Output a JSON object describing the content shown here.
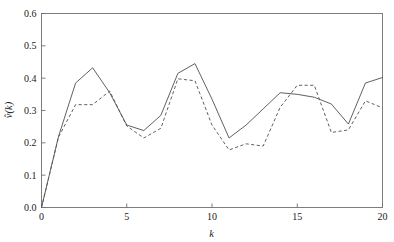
{
  "chart_data": {
    "type": "line",
    "title": "",
    "subtitle": "",
    "xlabel": "k",
    "ylabel": "v̂(k)",
    "xlim": [
      0,
      20
    ],
    "ylim": [
      0.0,
      0.6
    ],
    "grid": false,
    "legend": null,
    "legend_position": "none",
    "x_ticks": [
      0,
      5,
      10,
      15,
      20
    ],
    "x_tick_labels": [
      "0",
      "5",
      "10",
      "15",
      "20"
    ],
    "y_ticks": [
      0.0,
      0.1,
      0.2,
      0.3,
      0.4,
      0.5,
      0.6
    ],
    "y_tick_labels": [
      "0.0",
      "0.1",
      "0.2",
      "0.3",
      "0.4",
      "0.5",
      "0.6"
    ],
    "x": [
      0,
      1,
      2,
      3,
      4,
      5,
      6,
      7,
      8,
      9,
      10,
      11,
      12,
      13,
      14,
      15,
      16,
      17,
      18,
      19,
      20
    ],
    "series": [
      {
        "name": "solid",
        "style": "solid",
        "color": "#595959",
        "values": [
          0.0,
          0.22,
          0.385,
          0.432,
          0.355,
          0.255,
          0.238,
          0.285,
          0.415,
          0.445,
          0.335,
          0.215,
          0.255,
          0.305,
          0.355,
          0.35,
          0.341,
          0.32,
          0.258,
          0.385,
          0.402
        ]
      },
      {
        "name": "dashed",
        "style": "dashed",
        "color": "#595959",
        "values": [
          0.0,
          0.218,
          0.318,
          0.318,
          0.36,
          0.252,
          0.215,
          0.245,
          0.398,
          0.392,
          0.255,
          0.178,
          0.197,
          0.19,
          0.31,
          0.378,
          0.378,
          0.232,
          0.24,
          0.33,
          0.308
        ]
      }
    ],
    "annotations": []
  },
  "axes": {
    "frame_color": "#707070",
    "background": "#ffffff"
  }
}
